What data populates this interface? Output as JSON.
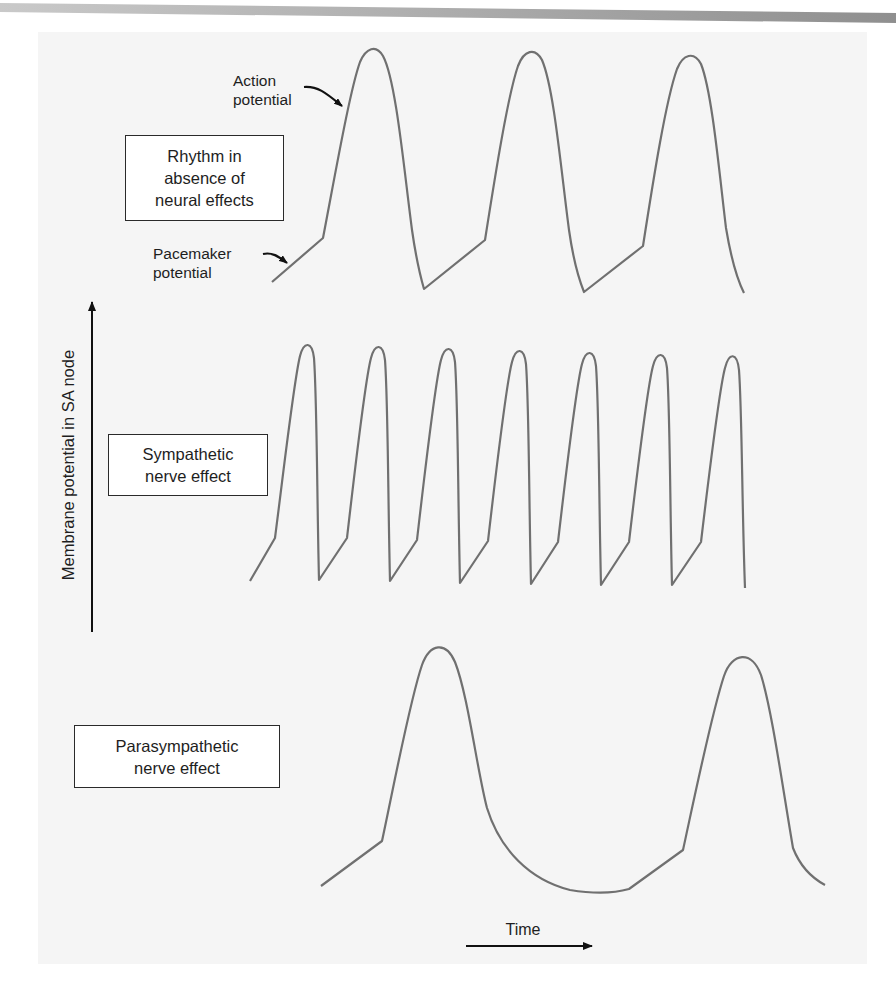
{
  "figure": {
    "y_axis_label": "Membrane potential in SA node",
    "x_axis_label": "Time",
    "annotations": {
      "action_potential": [
        "Action",
        "potential"
      ],
      "pacemaker_potential": [
        "Pacemaker",
        "potential"
      ]
    },
    "panels": [
      {
        "id": "baseline",
        "label": [
          "Rhythm in",
          "absence of",
          "neural effects"
        ],
        "beats": 3
      },
      {
        "id": "sympathetic",
        "label": [
          "Sympathetic",
          "nerve effect"
        ],
        "beats": 7
      },
      {
        "id": "parasympathetic",
        "label": [
          "Parasympathetic",
          "nerve effect"
        ],
        "beats": 2
      }
    ],
    "colors": {
      "trace": "#707070",
      "axis": "#111111",
      "box_border": "#2a2a2a",
      "page_bg": "#f5f5f5",
      "top_band": "#a8a8a8"
    }
  }
}
